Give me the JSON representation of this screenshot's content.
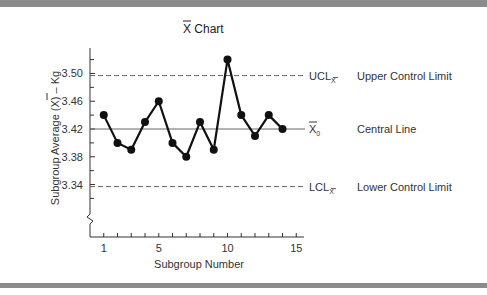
{
  "chart_data": {
    "type": "line",
    "title": "X Chart",
    "title_overbar": "X",
    "xlabel": "Subgroup Number",
    "ylabel": "Subgroup Average (X) – Kg",
    "x": [
      1,
      2,
      3,
      4,
      5,
      6,
      7,
      8,
      9,
      10,
      11,
      12,
      13,
      14
    ],
    "series": [
      {
        "name": "Subgroup Average",
        "values": [
          3.44,
          3.4,
          3.39,
          3.43,
          3.46,
          3.4,
          3.38,
          3.43,
          3.39,
          3.52,
          3.44,
          3.41,
          3.44,
          3.42
        ]
      }
    ],
    "x_ticks": [
      1,
      5,
      10,
      15
    ],
    "x_minor_ticks": [
      1,
      2,
      3,
      4,
      5,
      6,
      7,
      8,
      9,
      10,
      11,
      12,
      13,
      14,
      15
    ],
    "y_ticks": [
      "3.50",
      "3.46",
      "3.42",
      "3.38",
      "3.34"
    ],
    "y_tick_values": [
      3.5,
      3.46,
      3.42,
      3.38,
      3.34
    ],
    "y_minor_tick_values": [
      3.52,
      3.48,
      3.44,
      3.4,
      3.36,
      3.32,
      3.3
    ],
    "ylim": [
      3.27,
      3.535
    ],
    "xlim": [
      0,
      15.4
    ],
    "axis_break": true,
    "grid": false,
    "control_lines": [
      {
        "id": "ucl",
        "value": 3.497,
        "style": "dashed",
        "symbol": "UCL",
        "subscript": "X",
        "description": "Upper Control Limit"
      },
      {
        "id": "center",
        "value": 3.42,
        "style": "solid",
        "symbol": "X",
        "subscript": "0",
        "description": "Central Line"
      },
      {
        "id": "lcl",
        "value": 3.337,
        "style": "dashed",
        "symbol": "LCL",
        "subscript": "X",
        "description": "Lower Control Limit"
      }
    ]
  },
  "colors": {
    "line": "#111111",
    "axis": "#333333",
    "control_line": "#666666",
    "frame_bar": "#8c8c8c"
  }
}
